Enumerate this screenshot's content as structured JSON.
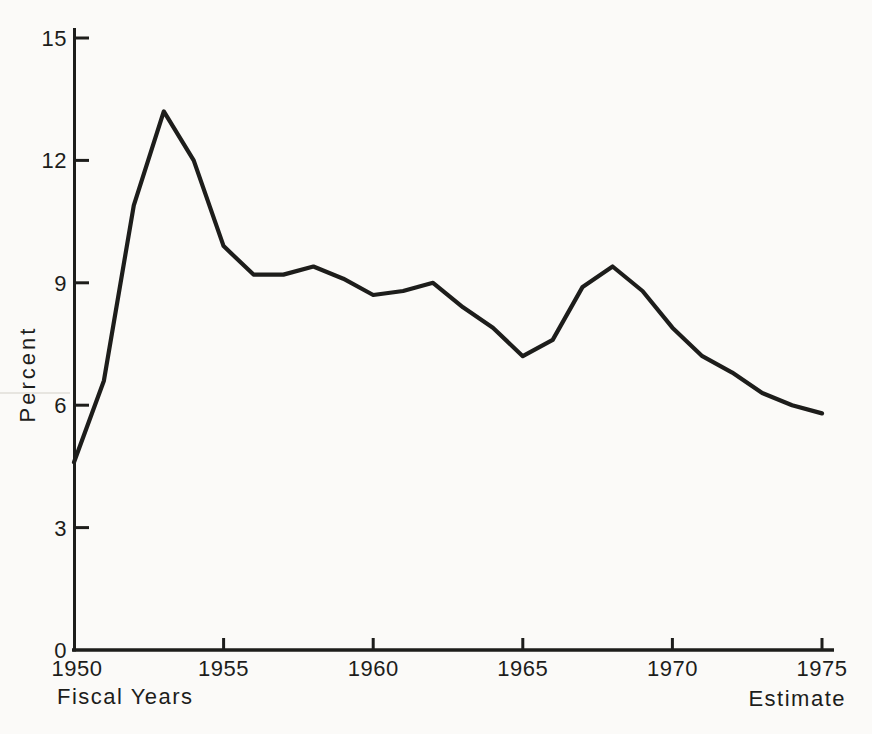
{
  "page": {
    "background": "#fbfaf8",
    "ink": "#1d1d1b"
  },
  "chart_data": {
    "type": "line",
    "title": "",
    "ylabel": "Percent",
    "xlabel": "Fiscal Years",
    "x_axis_note": "Estimate",
    "x": [
      1950,
      1951,
      1952,
      1953,
      1954,
      1955,
      1956,
      1957,
      1958,
      1959,
      1960,
      1961,
      1962,
      1963,
      1964,
      1965,
      1966,
      1967,
      1968,
      1969,
      1970,
      1971,
      1972,
      1973,
      1974,
      1975
    ],
    "values": [
      4.6,
      6.6,
      10.9,
      13.2,
      12.0,
      9.9,
      9.2,
      9.2,
      9.4,
      9.1,
      8.7,
      8.8,
      9.0,
      8.4,
      7.9,
      7.2,
      7.6,
      8.9,
      9.4,
      8.8,
      7.9,
      7.2,
      6.8,
      6.3,
      6.0,
      5.8
    ],
    "xticks": [
      1950,
      1955,
      1960,
      1965,
      1970,
      1975
    ],
    "yticks": [
      0,
      3,
      6,
      9,
      12,
      15
    ],
    "xlim": [
      1950,
      1975
    ],
    "ylim": [
      0,
      15
    ],
    "grid": false,
    "legend_position": "none",
    "line_color": "#1d1d1b"
  }
}
